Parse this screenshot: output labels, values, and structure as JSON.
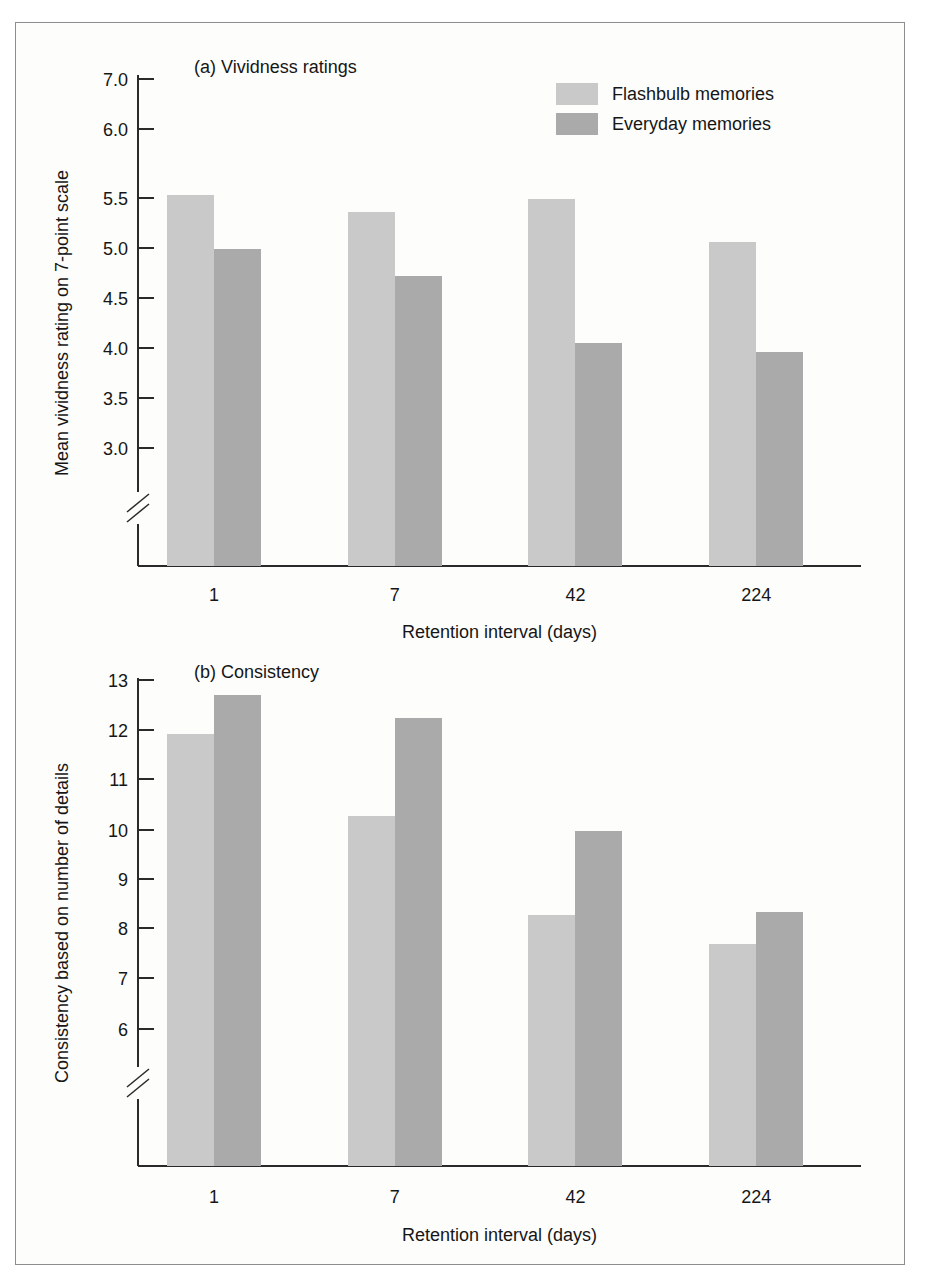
{
  "figure": {
    "border_color": "#8d8d8d",
    "background": "#fdfdfc"
  },
  "series_colors": {
    "flashbulb": "#c9c9c9",
    "everyday": "#aaaaaa"
  },
  "legend": {
    "items": [
      {
        "label": "Flashbulb memories",
        "color": "#c9c9c9",
        "key": "flashbulb"
      },
      {
        "label": "Everyday memories",
        "color": "#aaaaaa",
        "key": "everyday"
      }
    ]
  },
  "chart_data": [
    {
      "id": "panel-a",
      "type": "bar",
      "title": "(a) Vividness ratings",
      "xlabel": "Retention interval (days)",
      "ylabel": "Mean vividness rating on 7-point scale",
      "categories": [
        "1",
        "7",
        "42",
        "224"
      ],
      "yticks": [
        3.0,
        3.5,
        4.0,
        4.5,
        5.0,
        5.5,
        6.0,
        7.0
      ],
      "ytick_labels": [
        "3.0",
        "3.5",
        "4.0",
        "4.5",
        "5.0",
        "5.5",
        "6.0",
        "7.0"
      ],
      "ylim": [
        2.7,
        7.0
      ],
      "axis_break": true,
      "grid": false,
      "legend_position": "top-right",
      "series": [
        {
          "name": "Flashbulb memories",
          "color": "#c9c9c9",
          "values": [
            5.52,
            5.36,
            5.49,
            5.06
          ]
        },
        {
          "name": "Everyday memories",
          "color": "#aaaaaa",
          "values": [
            4.99,
            4.72,
            4.05,
            3.96
          ]
        }
      ]
    },
    {
      "id": "panel-b",
      "type": "bar",
      "title": "(b) Consistency",
      "xlabel": "Retention interval (days)",
      "ylabel": "Consistency based on number of details",
      "categories": [
        "1",
        "7",
        "42",
        "224"
      ],
      "yticks": [
        6,
        7,
        8,
        9,
        10,
        11,
        12,
        13
      ],
      "ytick_labels": [
        "6",
        "7",
        "8",
        "9",
        "10",
        "11",
        "12",
        "13"
      ],
      "ylim": [
        5.25,
        13
      ],
      "axis_break": true,
      "grid": false,
      "legend_position": "none",
      "series": [
        {
          "name": "Flashbulb memories",
          "color": "#c9c9c9",
          "values": [
            11.92,
            10.27,
            8.26,
            7.69
          ]
        },
        {
          "name": "Everyday memories",
          "color": "#aaaaaa",
          "values": [
            12.7,
            12.24,
            9.97,
            8.32
          ]
        }
      ]
    }
  ]
}
